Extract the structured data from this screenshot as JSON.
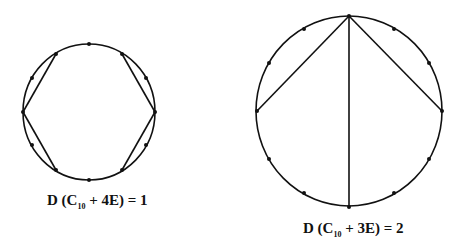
{
  "figures": [
    {
      "id": "left",
      "label": {
        "prefix": "D (C",
        "sub": "10",
        "suffix": " + 4E) = 1"
      },
      "circle": {
        "cx": 89,
        "cy": 112,
        "rx": 66,
        "ry": 68
      },
      "vertices": [
        [
          89,
          44
        ],
        [
          122,
          54
        ],
        [
          146,
          78
        ],
        [
          155,
          112
        ],
        [
          146,
          145
        ],
        [
          122,
          170
        ],
        [
          89,
          180
        ],
        [
          56,
          170
        ],
        [
          32,
          145
        ],
        [
          23,
          112
        ],
        [
          32,
          78
        ],
        [
          56,
          54
        ]
      ],
      "edges": [
        [
          [
            56,
            54
          ],
          [
            23,
            112
          ]
        ],
        [
          [
            23,
            112
          ],
          [
            56,
            170
          ]
        ],
        [
          [
            122,
            54
          ],
          [
            155,
            112
          ]
        ],
        [
          [
            155,
            112
          ],
          [
            122,
            170
          ]
        ]
      ]
    },
    {
      "id": "right",
      "label": {
        "prefix": "D (C",
        "sub": "10",
        "suffix": " + 3E) = 2"
      },
      "circle": {
        "cx": 349,
        "cy": 111,
        "rx": 93,
        "ry": 95
      },
      "vertices": [
        [
          349,
          16
        ],
        [
          394,
          29
        ],
        [
          429,
          63
        ],
        [
          442,
          111
        ],
        [
          429,
          159
        ],
        [
          394,
          193
        ],
        [
          349,
          207
        ],
        [
          304,
          193
        ],
        [
          269,
          159
        ],
        [
          257,
          111
        ],
        [
          269,
          63
        ],
        [
          304,
          29
        ]
      ],
      "edges": [
        [
          [
            349,
            16
          ],
          [
            257,
            111
          ]
        ],
        [
          [
            349,
            16
          ],
          [
            442,
            111
          ]
        ],
        [
          [
            349,
            16
          ],
          [
            349,
            207
          ]
        ]
      ]
    }
  ],
  "colors": {
    "stroke": "#111111",
    "background": "#ffffff"
  }
}
